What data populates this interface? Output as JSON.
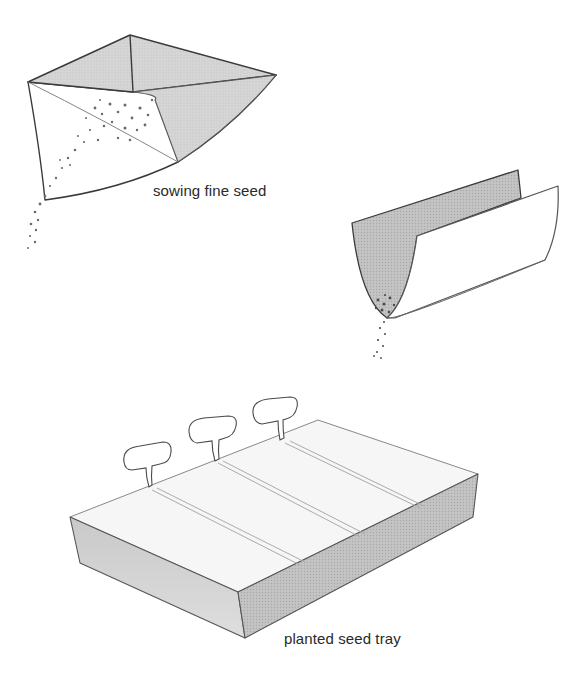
{
  "illustration": {
    "figures": [
      {
        "id": "envelope",
        "caption": "sowing fine seed",
        "subject": "seed packet / envelope tipping fine seed"
      },
      {
        "id": "folded-paper",
        "caption": "",
        "subject": "folded paper trough pouring seed"
      },
      {
        "id": "seed-tray",
        "caption": "planted seed tray",
        "subject": "seed tray with three plant labels and sown rows"
      }
    ],
    "colors": {
      "ink": "#3a3a3a",
      "shade": "#cfcfcf",
      "shade_dark": "#b8b8b8",
      "paper": "#ffffff",
      "seed": "#6a6a6a"
    }
  }
}
